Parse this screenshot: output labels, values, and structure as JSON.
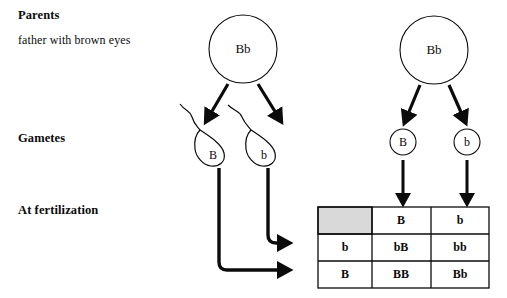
{
  "diagram": {
    "title_labels": {
      "parents": "Parents",
      "father": "father with brown eyes",
      "gametes": "Gametes",
      "fertilization": "At fertilization"
    },
    "parents": [
      {
        "name": "father-parent",
        "genotype": "Bb",
        "side": "left"
      },
      {
        "name": "mother-parent",
        "genotype": "Bb",
        "side": "right"
      }
    ],
    "gametes": {
      "sperm": [
        {
          "allele": "B"
        },
        {
          "allele": "b"
        }
      ],
      "eggs": [
        {
          "allele": "B"
        },
        {
          "allele": "b"
        }
      ]
    },
    "punnett_square": {
      "corner_cell": "",
      "column_headers": [
        "B",
        "b"
      ],
      "row_headers": [
        "b",
        "B"
      ],
      "cells": [
        [
          "bB",
          "bb"
        ],
        [
          "BB",
          "Bb"
        ]
      ],
      "shaded_corner_color": "#d9d9d9"
    },
    "colors": {
      "ink": "#0b0b0b",
      "paper": "#ffffff",
      "shade": "#d9d9d9"
    }
  }
}
